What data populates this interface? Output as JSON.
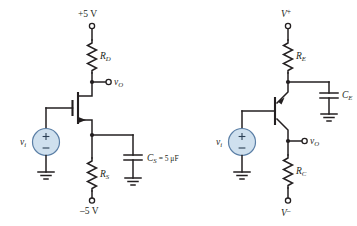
{
  "figure": {
    "type": "circuit-schematic",
    "colors": {
      "ink": "#231f20",
      "source_fill": "#cfe0ee",
      "source_stroke": "#5b7fa6",
      "background": "#ffffff"
    }
  },
  "circuits": [
    {
      "id": "left",
      "name": "common-source-mosfet-amplifier",
      "device": "n-channel MOSFET",
      "supply_top": {
        "label_main": "+5 V",
        "label_sub": "",
        "label_sup": ""
      },
      "supply_bottom": {
        "label_main": "–5 V",
        "label_sub": "",
        "label_sup": ""
      },
      "drain_resistor": {
        "label_main": "R",
        "label_sub": "D"
      },
      "source_resistor": {
        "label_main": "R",
        "label_sub": "S"
      },
      "bypass_capacitor": {
        "label_main": "C",
        "label_sub": "S",
        "label_value": " = 5 μF"
      },
      "input_source": {
        "label_main": "v",
        "label_sub": "i",
        "plus": "+",
        "minus": "–"
      },
      "output_node": {
        "label_main": "v",
        "label_sub": "O"
      }
    },
    {
      "id": "right",
      "name": "common-base-bjt-amplifier",
      "device": "pnp BJT",
      "supply_top": {
        "label_main": "V",
        "label_sup": "+",
        "label_sub": ""
      },
      "supply_bottom": {
        "label_main": "V",
        "label_sup": "–",
        "label_sub": ""
      },
      "emitter_resistor": {
        "label_main": "R",
        "label_sub": "E"
      },
      "collector_resistor": {
        "label_main": "R",
        "label_sub": "C"
      },
      "bypass_capacitor": {
        "label_main": "C",
        "label_sub": "E",
        "label_value": ""
      },
      "input_source": {
        "label_main": "v",
        "label_sub": "i",
        "plus": "+",
        "minus": "–"
      },
      "output_node": {
        "label_main": "v",
        "label_sub": "O"
      }
    }
  ]
}
